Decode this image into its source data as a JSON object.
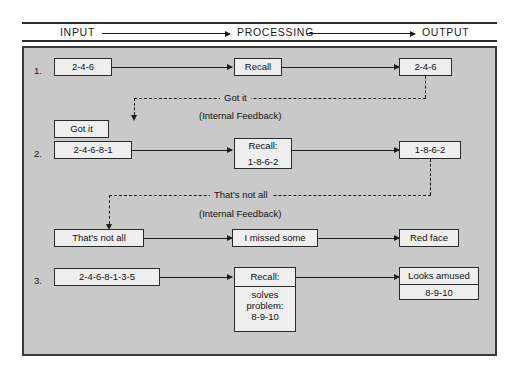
{
  "header": {
    "input_label": "INPUT",
    "processing_label": "PROCESSING",
    "output_label": "OUTPUT"
  },
  "rows": [
    {
      "number": "1.",
      "input": "2-4-6",
      "processing": "Recall",
      "output": "2-4-6",
      "feedback_label": "Got it",
      "feedback_sub": "(Internal Feedback)",
      "feedback_box": "Got it"
    },
    {
      "number": "2.",
      "input": "2-4-6-8-1",
      "processing_title": "Recall:",
      "processing_value": "1-8-6-2",
      "output": "1-8-6-2",
      "feedback_label": "That's not all",
      "feedback_sub": "(Internal Feedback)",
      "feedback_box": "That's not all",
      "feedback_processing": "I missed some",
      "feedback_output": "Red face"
    },
    {
      "number": "3.",
      "input": "2-4-6-8-1-3-5",
      "processing_title": "Recall:",
      "processing_line1": "solves",
      "processing_line2": "problem:",
      "processing_line3": "8-9-10",
      "output_line1": "Looks amused",
      "output_line2": "8-9-10"
    }
  ],
  "colors": {
    "plate_background": "#c9c9c9",
    "box_fill": "#efefef",
    "line": "#1b1b1b",
    "frame": "#3a3a3a"
  }
}
